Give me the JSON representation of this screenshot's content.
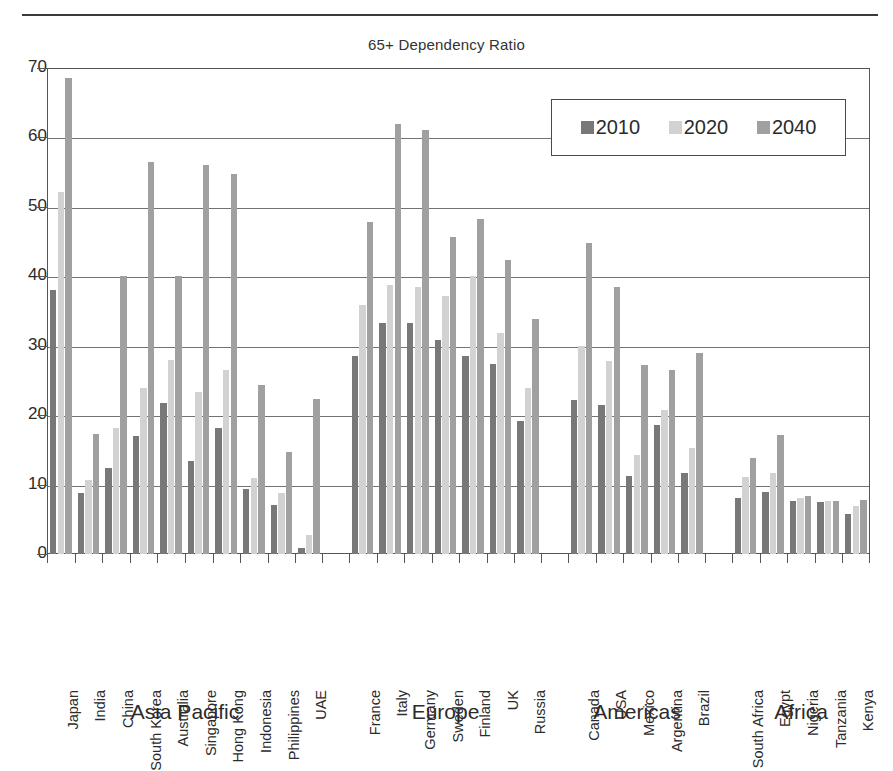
{
  "title": "65+ Dependency Ratio",
  "legend": {
    "entries": [
      {
        "label": "2010",
        "color": "#787878"
      },
      {
        "label": "2020",
        "color": "#d2d2d2"
      },
      {
        "label": "2040",
        "color": "#a0a0a0"
      }
    ]
  },
  "axis": {
    "y_ticks": [
      "0",
      "10",
      "20",
      "30",
      "40",
      "50",
      "60",
      "70"
    ]
  },
  "regions": [
    {
      "name": "Asia Pacific",
      "count": 10
    },
    {
      "name": "Europe",
      "count": 7
    },
    {
      "name": "Americas",
      "count": 5
    },
    {
      "name": "Africa",
      "count": 5
    }
  ],
  "chart_data": {
    "type": "bar",
    "title": "65+ Dependency Ratio",
    "xlabel": "",
    "ylabel": "",
    "ylim": [
      0,
      70
    ],
    "ytick_step": 10,
    "grid": true,
    "legend_position": "top-right",
    "categories": [
      "Japan",
      "India",
      "China",
      "South Korea",
      "Australia",
      "Singapore",
      "Hong Kong",
      "Indonesia",
      "Philippines",
      "UAE",
      "France",
      "Italy",
      "Germany",
      "Sweden",
      "Finland",
      "UK",
      "Russia",
      "Canada",
      "USA",
      "Mexico",
      "Argentina",
      "Brazil",
      "South Africa",
      "Egypt",
      "Nigeria",
      "Tanzania",
      "Kenya"
    ],
    "series": [
      {
        "name": "2010",
        "color": "#787878",
        "values": [
          38.0,
          8.8,
          12.4,
          17.0,
          21.8,
          13.4,
          18.2,
          9.4,
          7.1,
          0.8,
          28.5,
          33.3,
          33.3,
          30.8,
          28.5,
          27.4,
          19.1,
          22.2,
          21.4,
          11.3,
          18.6,
          11.6,
          8.1,
          9.0,
          7.7,
          7.5,
          5.8
        ]
      },
      {
        "name": "2020",
        "color": "#d2d2d2",
        "values": [
          52.1,
          10.6,
          18.2,
          23.9,
          27.9,
          23.3,
          26.5,
          10.9,
          8.8,
          2.8,
          35.9,
          38.8,
          38.4,
          37.2,
          40.1,
          31.8,
          23.9,
          29.9,
          27.8,
          14.2,
          20.8,
          15.3,
          11.1,
          11.7,
          8.1,
          7.6,
          6.9
        ]
      },
      {
        "name": "2040",
        "color": "#a0a0a0",
        "values": [
          68.6,
          17.3,
          40.0,
          56.5,
          40.0,
          56.0,
          54.7,
          24.4,
          14.7,
          22.3,
          47.8,
          61.9,
          61.1,
          45.6,
          48.2,
          42.3,
          33.8,
          44.8,
          38.4,
          27.2,
          26.5,
          28.9,
          13.9,
          17.2,
          8.3,
          7.6,
          7.8
        ]
      }
    ],
    "region_groups": [
      {
        "name": "Asia Pacific",
        "categories": [
          "Japan",
          "India",
          "China",
          "South Korea",
          "Australia",
          "Singapore",
          "Hong Kong",
          "Indonesia",
          "Philippines",
          "UAE"
        ]
      },
      {
        "name": "Europe",
        "categories": [
          "France",
          "Italy",
          "Germany",
          "Sweden",
          "Finland",
          "UK",
          "Russia"
        ]
      },
      {
        "name": "Americas",
        "categories": [
          "Canada",
          "USA",
          "Mexico",
          "Argentina",
          "Brazil"
        ]
      },
      {
        "name": "Africa",
        "categories": [
          "South Africa",
          "Egypt",
          "Nigeria",
          "Tanzania",
          "Kenya"
        ]
      }
    ]
  }
}
